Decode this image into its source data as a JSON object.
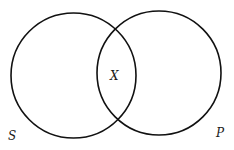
{
  "diagram": {
    "type": "venn",
    "sets": [
      {
        "label": "S",
        "cx": 73.5,
        "cy": 75.5,
        "r": 62.5
      },
      {
        "label": "P",
        "cx": 159,
        "cy": 73,
        "r": 62
      }
    ],
    "intersection_label": "X",
    "stroke_color": "#111111",
    "background": "#ffffff"
  }
}
